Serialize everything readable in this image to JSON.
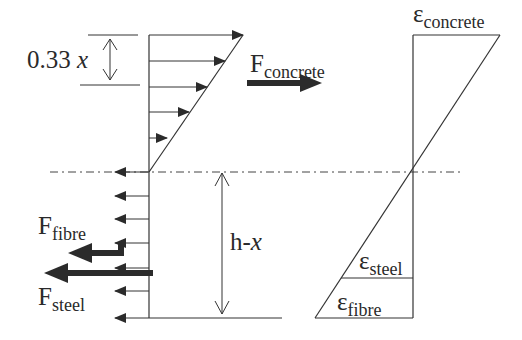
{
  "diagram": {
    "type": "stress-strain cross-section diagram",
    "stress_block": {
      "compression_zone_label": {
        "value": "0.33",
        "var": "x"
      },
      "tension_depth_label": {
        "prefix": "h-",
        "var": "x"
      },
      "forces": {
        "concrete": {
          "symbol": "F",
          "subscript": "concrete"
        },
        "fibre": {
          "symbol": "F",
          "subscript": "fibre"
        },
        "steel": {
          "symbol": "F",
          "subscript": "steel"
        }
      }
    },
    "strain_diagram": {
      "concrete": {
        "symbol": "ε",
        "subscript": "concrete"
      },
      "steel": {
        "symbol": "ε",
        "subscript": "steel"
      },
      "fibre": {
        "symbol": "ε",
        "subscript": "fibre"
      }
    },
    "colors": {
      "line": "#333333",
      "arrow_fill": "#2b2b2b",
      "background": "#ffffff"
    }
  }
}
